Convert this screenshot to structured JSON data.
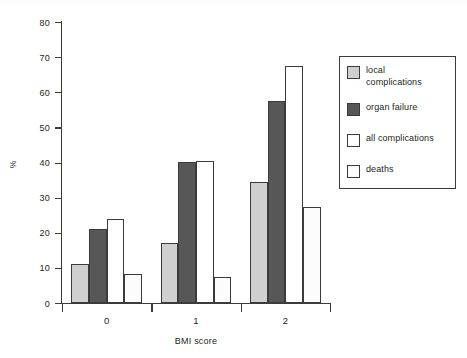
{
  "chart_data": {
    "type": "bar",
    "title": "",
    "subtitle": "",
    "xlabel": "BMI score",
    "ylabel": "%",
    "categories": [
      "0",
      "1",
      "2"
    ],
    "ylim": [
      0,
      80
    ],
    "yticks": [
      0,
      10,
      20,
      30,
      40,
      50,
      60,
      70,
      80
    ],
    "ytick_labels": [
      "0",
      "10",
      "20",
      "30",
      "40",
      "50",
      "60",
      "70",
      "80"
    ],
    "grid": false,
    "legend_position": "right",
    "series": [
      {
        "name": "local complications",
        "label_lines": "local\ncomplications",
        "color": "#cfcfcf",
        "values": [
          11,
          17.2,
          34.4
        ]
      },
      {
        "name": "organ failure",
        "label_lines": "organ failure",
        "color": "#575757",
        "values": [
          21.1,
          40.2,
          57.4
        ]
      },
      {
        "name": "all complications",
        "label_lines": "all complications",
        "color": "#ffffff",
        "values": [
          24,
          40.3,
          67.4
        ]
      },
      {
        "name": "deaths",
        "label_lines": "deaths",
        "color": "#fcfcfc",
        "values": [
          8.2,
          7.4,
          27.3
        ]
      }
    ]
  },
  "axis": {
    "y_title": "%",
    "x_title": "BMI score"
  },
  "colors": {
    "axis": "#3b3b3b",
    "text": "#231f20",
    "local_complications": "#cfcfcf",
    "organ_failure": "#575757",
    "all_complications": "#ffffff",
    "deaths": "#fcfcfc",
    "background": "#ffffff"
  }
}
